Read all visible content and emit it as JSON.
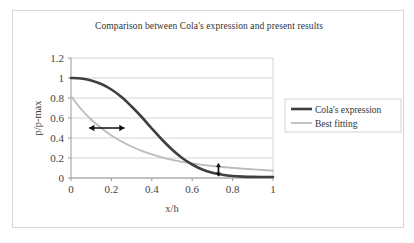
{
  "chart_data": {
    "type": "line",
    "title": "Comparison between Cola's expression and present results",
    "xlabel": "x/h",
    "ylabel": "p/p-max",
    "xlim": [
      0,
      1
    ],
    "ylim": [
      0,
      1.2
    ],
    "xticks": [
      "0",
      "0.2",
      "0.4",
      "0.6",
      "0.8",
      "1"
    ],
    "xtick_values": [
      0,
      0.2,
      0.4,
      0.6,
      0.8,
      1
    ],
    "yticks": [
      "0",
      "0.2",
      "0.4",
      "0.6",
      "0.8",
      "1",
      "1.2"
    ],
    "ytick_values": [
      0,
      0.2,
      0.4,
      0.6,
      0.8,
      1,
      1.2
    ],
    "grid": "horizontal",
    "legend_position": "right",
    "series": [
      {
        "name": "Cola's expression",
        "color": "#3f3f3f",
        "width": 2.6,
        "x": [
          0,
          0.05,
          0.1,
          0.15,
          0.2,
          0.25,
          0.3,
          0.35,
          0.4,
          0.45,
          0.5,
          0.55,
          0.6,
          0.65,
          0.7,
          0.75,
          0.8,
          0.85,
          0.9,
          0.95,
          1
        ],
        "values": [
          1.0,
          0.995,
          0.975,
          0.94,
          0.885,
          0.81,
          0.715,
          0.61,
          0.495,
          0.385,
          0.285,
          0.2,
          0.135,
          0.085,
          0.052,
          0.032,
          0.02,
          0.014,
          0.011,
          0.01,
          0.01
        ]
      },
      {
        "name": "Best fitting",
        "color": "#bcbcbc",
        "width": 1.8,
        "x": [
          0,
          0.05,
          0.1,
          0.15,
          0.2,
          0.25,
          0.3,
          0.35,
          0.4,
          0.45,
          0.5,
          0.55,
          0.6,
          0.65,
          0.7,
          0.75,
          0.8,
          0.85,
          0.9,
          0.95,
          1
        ],
        "values": [
          0.82,
          0.69,
          0.585,
          0.5,
          0.425,
          0.365,
          0.315,
          0.272,
          0.236,
          0.206,
          0.182,
          0.162,
          0.146,
          0.132,
          0.12,
          0.11,
          0.102,
          0.094,
          0.087,
          0.08,
          0.073
        ]
      }
    ],
    "annotations": [
      {
        "name": "horizontal-span-arrow",
        "kind": "double-arrow-horizontal",
        "x_start": 0.09,
        "x_end": 0.265,
        "y": 0.5
      },
      {
        "name": "vertical-gap-arrow",
        "kind": "double-arrow-vertical",
        "x": 0.73,
        "y_start": 0.018,
        "y_end": 0.145
      }
    ]
  },
  "legend": {
    "entries": [
      {
        "label": "Cola's expression"
      },
      {
        "label": "Best fitting"
      }
    ]
  }
}
